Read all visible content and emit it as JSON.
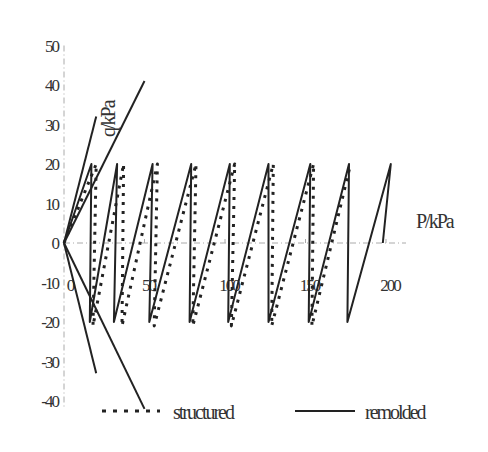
{
  "chart_data": {
    "type": "line",
    "title": "",
    "xlabel": "P/kPa",
    "ylabel": "q/kPa",
    "xlim": [
      0,
      200
    ],
    "ylim": [
      -40,
      50
    ],
    "x_ticks": [
      "0",
      "50",
      "100",
      "150",
      "200"
    ],
    "y_ticks": [
      "50",
      "40",
      "30",
      "20",
      "10",
      "0",
      "-10",
      "-20",
      "-30",
      "-40"
    ],
    "grid": false,
    "legend_position": "bottom",
    "legend": [
      "structured",
      "remolded"
    ],
    "series": [
      {
        "name": "remolded",
        "style": "solid",
        "points": [
          [
            0,
            0
          ],
          [
            17,
            20
          ],
          [
            16,
            -20
          ],
          [
            33,
            20
          ],
          [
            31,
            -20
          ],
          [
            55,
            20
          ],
          [
            53,
            -20
          ],
          [
            79,
            20
          ],
          [
            78,
            -20
          ],
          [
            103,
            20
          ],
          [
            102,
            -20
          ],
          [
            127,
            20
          ],
          [
            127,
            -20
          ],
          [
            153,
            20
          ],
          [
            152,
            -20
          ],
          [
            177,
            20
          ],
          [
            176,
            -20
          ],
          [
            203,
            20
          ],
          [
            198,
            0
          ]
        ]
      },
      {
        "name": "structured",
        "style": "dotted",
        "points": [
          [
            0,
            0
          ],
          [
            20,
            20
          ],
          [
            18,
            -21
          ],
          [
            37,
            20
          ],
          [
            36,
            -21
          ],
          [
            58,
            20
          ],
          [
            56,
            -21
          ],
          [
            82,
            20
          ],
          [
            80,
            -21
          ],
          [
            106,
            20
          ],
          [
            104,
            -21
          ],
          [
            130,
            20
          ],
          [
            129,
            -21
          ],
          [
            155,
            20
          ],
          [
            154,
            -21
          ],
          [
            178,
            20
          ]
        ]
      },
      {
        "name": "stress-path lines (remolded)",
        "style": "solid",
        "segments": [
          [
            [
              0,
              0
            ],
            [
              20,
              32
            ]
          ],
          [
            [
              0,
              0
            ],
            [
              50,
              41
            ]
          ],
          [
            [
              0,
              0
            ],
            [
              20,
              -33
            ]
          ],
          [
            [
              0,
              0
            ],
            [
              50,
              -42
            ]
          ]
        ]
      }
    ]
  },
  "labels": {
    "ylabel": "q/kPa",
    "xlabel": "P/kPa",
    "legend_structured": "structured",
    "legend_remolded": "remolded"
  },
  "colors": {
    "line": "#222222",
    "axis": "#aaaaaa",
    "text": "#333333"
  }
}
